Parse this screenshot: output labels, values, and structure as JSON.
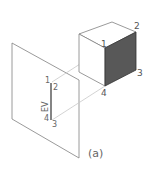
{
  "figure": {
    "caption": "(a)",
    "cube_labels": {
      "v1": "1",
      "v2": "2",
      "v3": "3",
      "v4": "4"
    },
    "plane_labels": {
      "top_left": "1",
      "top_right": "2",
      "bottom_left": "4",
      "bottom_right": "3",
      "edge_view": "EV"
    },
    "colors": {
      "line": "#808080",
      "projector": "#c8c8c8",
      "shaded_face": "#585858",
      "edge_view_line": "#333333"
    }
  }
}
